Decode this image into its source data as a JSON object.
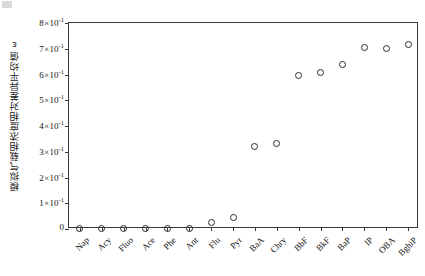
{
  "chart_data": {
    "type": "scatter",
    "title": "",
    "xlabel": "",
    "ylabel": "模拟气载相浓度相对差异平均值ε",
    "ylabel_symbol": "ε",
    "categories": [
      "Nap",
      "Acy",
      "Fluo",
      "Ace",
      "Phe",
      "Ant",
      "Flu",
      "Pyr",
      "BaA",
      "Chry",
      "BbF",
      "BkF",
      "BaP",
      "IP",
      "OBA",
      "BghiP"
    ],
    "values": [
      0.002,
      0.002,
      0.002,
      0.002,
      0.002,
      0.002,
      0.025,
      0.045,
      0.32,
      0.332,
      0.598,
      0.606,
      0.64,
      0.705,
      0.702,
      0.716
    ],
    "ylim": [
      0,
      0.8
    ],
    "ytick_values": [
      0,
      0.1,
      0.2,
      0.3,
      0.4,
      0.5,
      0.6,
      0.7,
      0.8
    ],
    "ytick_labels": [
      {
        "mantissa": "0",
        "show_power": false,
        "exponent": ""
      },
      {
        "mantissa": "1",
        "show_power": true,
        "exponent": "-1"
      },
      {
        "mantissa": "2",
        "show_power": true,
        "exponent": "-1"
      },
      {
        "mantissa": "3",
        "show_power": true,
        "exponent": "-1"
      },
      {
        "mantissa": "4",
        "show_power": true,
        "exponent": "-1"
      },
      {
        "mantissa": "5",
        "show_power": true,
        "exponent": "-1"
      },
      {
        "mantissa": "6",
        "show_power": true,
        "exponent": "-1"
      },
      {
        "mantissa": "7",
        "show_power": true,
        "exponent": "-1"
      },
      {
        "mantissa": "8",
        "show_power": true,
        "exponent": "-1"
      }
    ],
    "grid": false,
    "legend": false,
    "marker": "open-circle",
    "marker_color": "#2b2b2b",
    "axis_color": "#3a3a3a",
    "background": "#ffffff"
  }
}
